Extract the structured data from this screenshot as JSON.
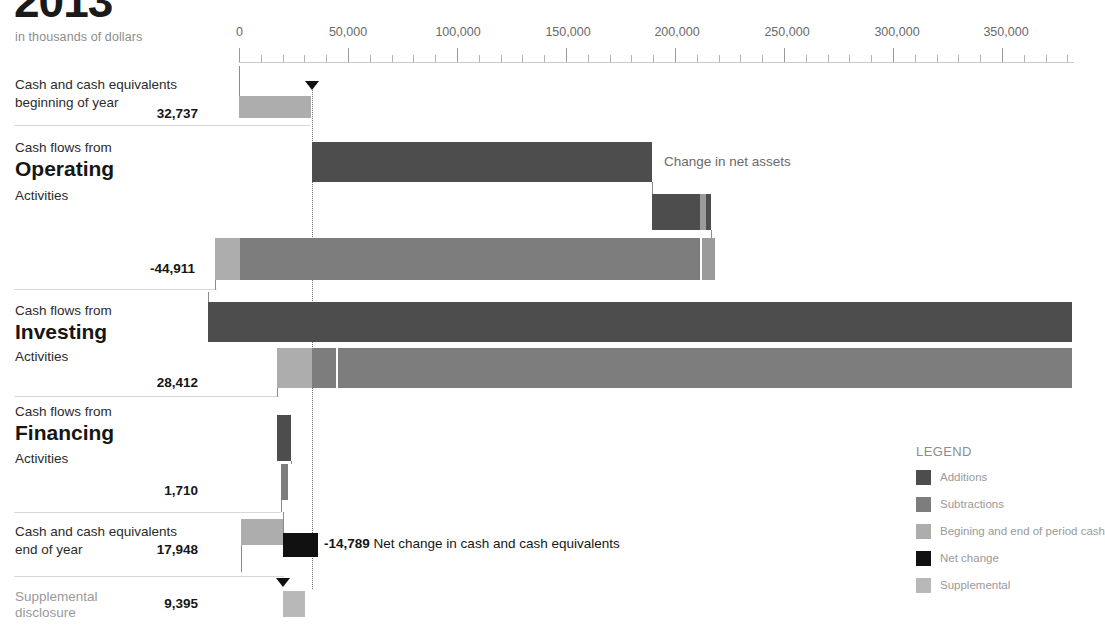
{
  "header": {
    "title": "2013",
    "subtitle": "in thousands of dollars"
  },
  "chart_data": {
    "type": "bar",
    "title": "2013",
    "subtitle": "in thousands of dollars",
    "units": "thousands of dollars",
    "xlabel": "",
    "ylabel": "",
    "xlim": [
      0,
      383000
    ],
    "grid": false,
    "axis_ticks": [
      "0",
      "50,000",
      "100,000",
      "150,000",
      "200,000",
      "250,000",
      "300,000",
      "350,000"
    ],
    "axis_tick_values": [
      0,
      50000,
      100000,
      150000,
      200000,
      250000,
      300000,
      350000
    ],
    "minor_tick_step": 10000,
    "legend_position": "bottom-right",
    "categories": [
      "Cash and cash equivalents beginning of year",
      "Cash flows from Operating Activities",
      "Cash flows from Investing Activities",
      "Cash flows from Financing Activities",
      "Cash and cash equivalents end of year",
      "Supplemental disclosure"
    ],
    "values": [
      32737,
      -44911,
      28412,
      1710,
      17948,
      9395
    ],
    "series": [
      {
        "name": "Additions",
        "color": "#4d4d4d"
      },
      {
        "name": "Subtractions",
        "color": "#7d7d7d"
      },
      {
        "name": "Begining and end of period cash",
        "color": "#adadad"
      },
      {
        "name": "Net change",
        "color": "#111111"
      },
      {
        "name": "Supplemental",
        "color": "#b8b8b8"
      }
    ],
    "net_change": -14789,
    "annotations": [
      {
        "text": "Change in net assets",
        "near": "operating-additions"
      },
      {
        "text": "-14,789 Net change in cash and cash equivalents",
        "near": "end-of-year"
      }
    ]
  },
  "rows": [
    {
      "id": "beginning-of-year",
      "line1": "Cash and cash equivalents",
      "line2": "beginning of year",
      "value": "32,737"
    },
    {
      "id": "operating",
      "line1": "Cash flows from",
      "big": "Operating",
      "line2": "Activities",
      "value": "-44,911"
    },
    {
      "id": "investing",
      "line1": "Cash flows from",
      "big": "Investing",
      "line2": "Activities",
      "value": "28,412"
    },
    {
      "id": "financing",
      "line1": "Cash flows from",
      "big": "Financing",
      "line2": "Activities",
      "value": "1,710"
    },
    {
      "id": "end-of-year",
      "line1": "Cash and cash equivalents",
      "line2": "end of year",
      "value": "17,948"
    },
    {
      "id": "supplemental",
      "line1": "Supplemental",
      "line2": "disclosure",
      "value": "9,395"
    }
  ],
  "annotations": {
    "change_in_net_assets": "Change in net assets",
    "net_change_value": "-14,789",
    "net_change_text": "Net change in cash and cash equivalents"
  },
  "legend": {
    "title": "LEGEND",
    "items": [
      {
        "label": "Additions",
        "color": "#4d4d4d"
      },
      {
        "label": "Subtractions",
        "color": "#7d7d7d"
      },
      {
        "label": "Begining and end of period cash",
        "color": "#adadad"
      },
      {
        "label": "Net change",
        "color": "#111111"
      },
      {
        "label": "Supplemental",
        "color": "#b8b8b8"
      }
    ]
  }
}
